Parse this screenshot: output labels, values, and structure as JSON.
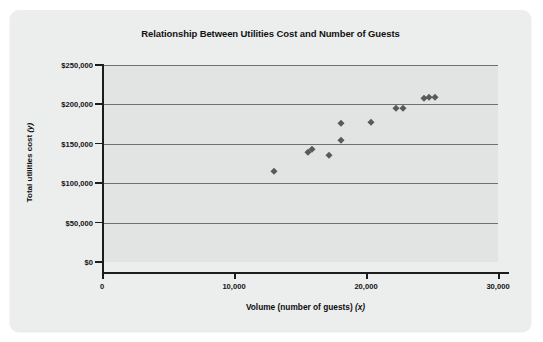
{
  "chart": {
    "title": "Relationship Between Utilities Cost and Number of Guests",
    "xlabel_main": "Volume (number of guests)",
    "xlabel_var": "(x)",
    "ylabel_main": "Total utilities cost",
    "ylabel_var": "(y)"
  },
  "chart_data": {
    "type": "scatter",
    "title": "Relationship Between Utilities Cost and Number of Guests",
    "xlabel": "Volume (number of guests) (x)",
    "ylabel": "Total utilities cost (y)",
    "xlim": [
      0,
      30000
    ],
    "ylim": [
      0,
      250000
    ],
    "xticks": [
      0,
      10000,
      20000,
      30000
    ],
    "xtick_labels": [
      "0",
      "10,000",
      "20,000",
      "30,000"
    ],
    "yticks": [
      0,
      50000,
      100000,
      150000,
      200000,
      250000
    ],
    "ytick_labels": [
      "$0",
      "$50,000",
      "$100,000",
      "$150,000",
      "$200,000",
      "$250,000"
    ],
    "grid": "horizontal",
    "legend": "none",
    "marker": "diamond",
    "marker_color": "#58595b",
    "points": [
      {
        "x": 13000,
        "y": 115000
      },
      {
        "x": 15600,
        "y": 140000
      },
      {
        "x": 15900,
        "y": 143000
      },
      {
        "x": 17200,
        "y": 136000
      },
      {
        "x": 18100,
        "y": 176000
      },
      {
        "x": 18100,
        "y": 155000
      },
      {
        "x": 20400,
        "y": 178000
      },
      {
        "x": 22300,
        "y": 195000
      },
      {
        "x": 22800,
        "y": 196000
      },
      {
        "x": 24400,
        "y": 208000
      },
      {
        "x": 24800,
        "y": 209000
      },
      {
        "x": 25200,
        "y": 209000
      }
    ]
  }
}
